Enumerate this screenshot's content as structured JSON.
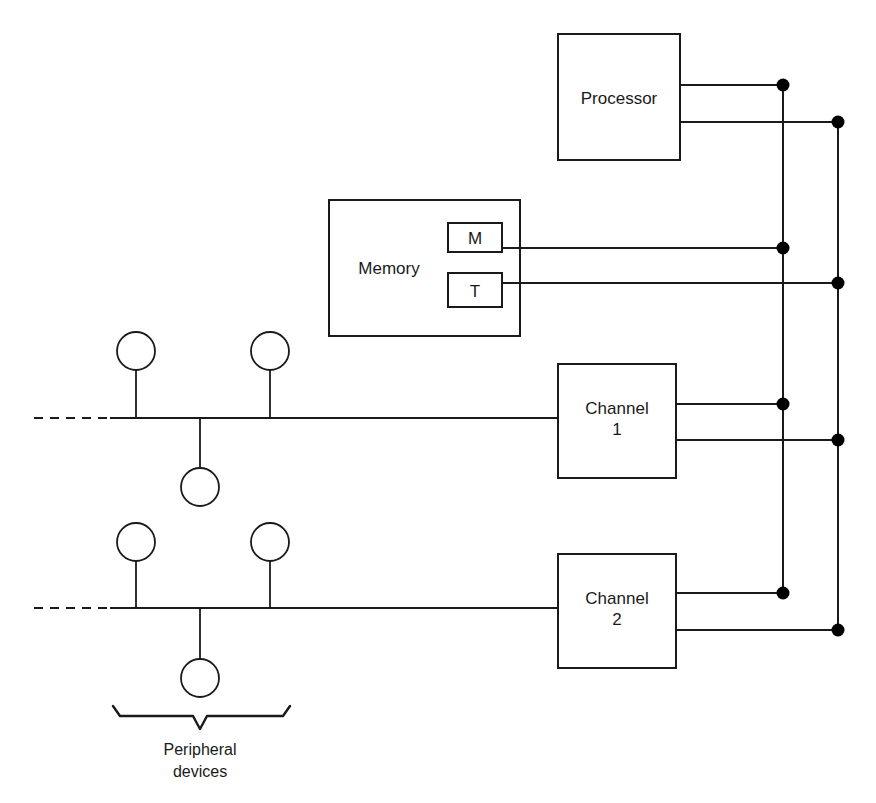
{
  "diagram": {
    "stroke_color": "#1a1a1a",
    "background_color": "#ffffff",
    "blocks": [
      {
        "id": "processor",
        "label": "Processor",
        "x": 558,
        "y": 34,
        "w": 122,
        "h": 126
      },
      {
        "id": "memory",
        "label": "Memory",
        "x": 329,
        "y": 200,
        "w": 191,
        "h": 136
      },
      {
        "id": "memory-m",
        "label": "M",
        "x": 448,
        "y": 223,
        "w": 54,
        "h": 29
      },
      {
        "id": "memory-t",
        "label": "T",
        "x": 448,
        "y": 273,
        "w": 54,
        "h": 34
      },
      {
        "id": "channel1",
        "label": "Channel",
        "label2": "1",
        "x": 558,
        "y": 364,
        "w": 118,
        "h": 114
      },
      {
        "id": "channel2",
        "label": "Channel",
        "label2": "2",
        "x": 558,
        "y": 554,
        "w": 118,
        "h": 114
      }
    ],
    "buses": {
      "inner_bus_x": 783,
      "outer_bus_x": 838,
      "inner_bus_top_y": 85,
      "outer_bus_top_y": 122,
      "inner_bus_bottom_y": 593,
      "outer_bus_bottom_y": 630
    },
    "junction_dots": [
      {
        "x": 783,
        "y": 85
      },
      {
        "x": 838,
        "y": 122
      },
      {
        "x": 783,
        "y": 248
      },
      {
        "x": 838,
        "y": 283
      },
      {
        "x": 783,
        "y": 404
      },
      {
        "x": 838,
        "y": 440
      },
      {
        "x": 783,
        "y": 593
      },
      {
        "x": 838,
        "y": 630
      }
    ],
    "peripheral_groups": [
      {
        "id": "group-1",
        "bus_y": 418,
        "dash_start_x": 34,
        "dash_end_x": 110,
        "bus_end_x": 558,
        "devices": [
          {
            "x": 136,
            "y": 351,
            "r": 19,
            "side": "up"
          },
          {
            "x": 270,
            "y": 351,
            "r": 19,
            "side": "up"
          },
          {
            "x": 200,
            "y": 487,
            "r": 19,
            "side": "down"
          }
        ]
      },
      {
        "id": "group-2",
        "bus_y": 608,
        "dash_start_x": 34,
        "dash_end_x": 110,
        "bus_end_x": 558,
        "devices": [
          {
            "x": 136,
            "y": 542,
            "r": 19,
            "side": "up"
          },
          {
            "x": 270,
            "y": 542,
            "r": 19,
            "side": "up"
          },
          {
            "x": 200,
            "y": 678,
            "r": 19,
            "side": "down"
          }
        ]
      }
    ],
    "brace": {
      "left_x": 113,
      "right_x": 290,
      "center_x": 200,
      "top_y": 706,
      "y": 716,
      "tip_y": 729
    },
    "brace_label": {
      "line1": "Peripheral",
      "line2": "devices",
      "x": 200,
      "y": 755
    }
  }
}
